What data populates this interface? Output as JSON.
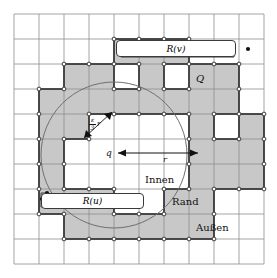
{
  "figure": {
    "name": "grid-region-diagram",
    "grid": {
      "origin_x": 14,
      "origin_y": 14,
      "cell": 25,
      "cols": 10,
      "rows": 10,
      "line_color": "#8d8d8d"
    },
    "colors": {
      "shade_fill": "#c8c8c8",
      "shade_stroke": "#3a3a3a",
      "grid_line": "#8d8d8d",
      "circle_stroke": "#6f6f6f",
      "text": "#111111",
      "box_bg": "#ffffff",
      "box_border": "#3a3a3a",
      "dot": "#111111"
    },
    "shaded_cells": [
      [
        4,
        1
      ],
      [
        5,
        1
      ],
      [
        6,
        1
      ],
      [
        2,
        2
      ],
      [
        3,
        2
      ],
      [
        5,
        2
      ],
      [
        7,
        2
      ],
      [
        8,
        2
      ],
      [
        1,
        3
      ],
      [
        2,
        3
      ],
      [
        3,
        3
      ],
      [
        4,
        3
      ],
      [
        5,
        3
      ],
      [
        6,
        3
      ],
      [
        7,
        3
      ],
      [
        8,
        3
      ],
      [
        1,
        4
      ],
      [
        2,
        4
      ],
      [
        7,
        4
      ],
      [
        9,
        4
      ],
      [
        1,
        5
      ],
      [
        7,
        5
      ],
      [
        8,
        5
      ],
      [
        9,
        5
      ],
      [
        1,
        6
      ],
      [
        7,
        6
      ],
      [
        8,
        6
      ],
      [
        9,
        6
      ],
      [
        1,
        7
      ],
      [
        2,
        7
      ],
      [
        3,
        7
      ],
      [
        6,
        7
      ],
      [
        7,
        7
      ],
      [
        2,
        8
      ],
      [
        3,
        8
      ],
      [
        4,
        8
      ],
      [
        5,
        8
      ],
      [
        6,
        8
      ],
      [
        7,
        8
      ]
    ],
    "circle": {
      "cx": 114,
      "cy": 155,
      "r": 73
    },
    "labels": {
      "R_v": "R(v)",
      "R_u": "R(u)",
      "Q": "Q",
      "q": "q",
      "r": "r",
      "eps_over_3_num": "ε",
      "eps_over_3_den": "3",
      "eps_over_3_tail": "r",
      "innen": "Innen",
      "rand": "Rand",
      "aussen": "Außen"
    },
    "dots": [
      {
        "name": "rv-dot-left",
        "x": 121,
        "y": 46
      },
      {
        "name": "rv-dot-topright",
        "x": 220,
        "y": 44
      },
      {
        "name": "rv-dot-far-right",
        "x": 248,
        "y": 49
      },
      {
        "name": "rv-dot-inner-right",
        "x": 232,
        "y": 55
      },
      {
        "name": "ru-dot-right",
        "x": 138,
        "y": 200
      },
      {
        "name": "ru-dot-upper-left",
        "x": 47,
        "y": 193
      },
      {
        "name": "ru-dot-mid-left",
        "x": 42,
        "y": 199
      },
      {
        "name": "ru-dot-lower-left",
        "x": 49,
        "y": 206
      }
    ]
  }
}
